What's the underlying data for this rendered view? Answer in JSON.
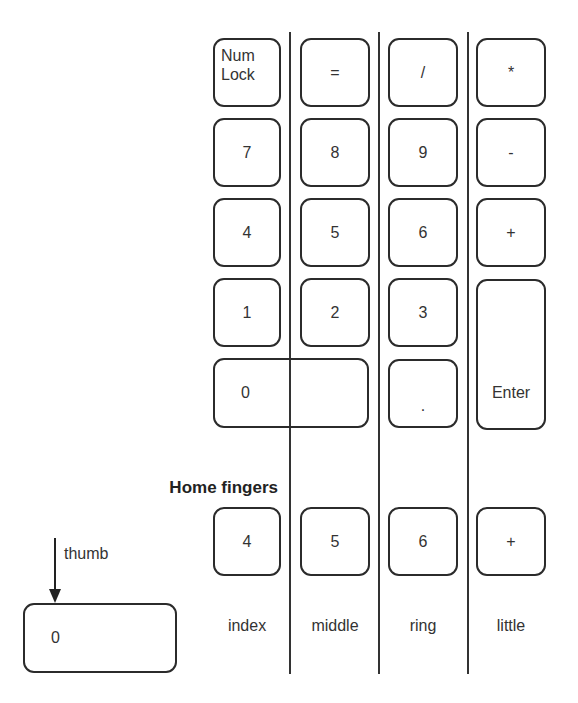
{
  "keypad": {
    "row1": {
      "numlock_line1": "Num",
      "numlock_line2": "Lock",
      "equals": "=",
      "divide": "/",
      "multiply": "*"
    },
    "row2": {
      "k7": "7",
      "k8": "8",
      "k9": "9",
      "minus": "-"
    },
    "row3": {
      "k4": "4",
      "k5": "5",
      "k6": "6",
      "plus": "+"
    },
    "row4": {
      "k1": "1",
      "k2": "2",
      "k3": "3",
      "enter": "Enter"
    },
    "row5": {
      "k0": "0",
      "decimal": "."
    }
  },
  "home": {
    "title": "Home fingers",
    "keys": [
      "4",
      "5",
      "6",
      "+"
    ]
  },
  "thumb": {
    "label": "thumb",
    "key": "0"
  },
  "fingers": [
    "index",
    "middle",
    "ring",
    "little"
  ]
}
